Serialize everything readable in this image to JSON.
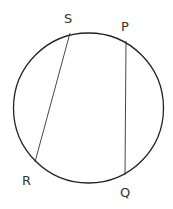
{
  "diagram": {
    "type": "circle-with-chords",
    "circle": {
      "cx": 88.5,
      "cy": 108,
      "r": 75
    },
    "points": [
      {
        "name": "S",
        "x": 70,
        "y": 33,
        "label_x": 64,
        "label_y": 23
      },
      {
        "name": "P",
        "x": 126,
        "y": 41,
        "label_x": 121,
        "label_y": 31
      },
      {
        "name": "R",
        "x": 35,
        "y": 162,
        "label_x": 22,
        "label_y": 185
      },
      {
        "name": "Q",
        "x": 125,
        "y": 175,
        "label_x": 120,
        "label_y": 197
      }
    ],
    "chords": [
      {
        "from": "S",
        "to": "R"
      },
      {
        "from": "P",
        "to": "Q"
      }
    ],
    "labels": {
      "S": "S",
      "P": "P",
      "R": "R",
      "Q": "Q"
    }
  }
}
